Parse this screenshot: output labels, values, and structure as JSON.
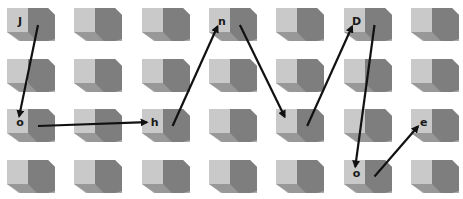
{
  "diagram": {
    "type": "cube-grid-path",
    "rows": 4,
    "cols": 7,
    "colors": {
      "front_face": "#c9c9c9",
      "side_face": "#7e7e7e",
      "bottom_face": "#8f8f8f",
      "edge_face": "#a9a9a9",
      "arrow": "#111111",
      "letter": "#1a1a1a",
      "background": "#ffffff"
    },
    "letters": [
      {
        "row": 0,
        "col": 0,
        "char": "J"
      },
      {
        "row": 2,
        "col": 0,
        "char": "o"
      },
      {
        "row": 2,
        "col": 2,
        "char": "h"
      },
      {
        "row": 0,
        "col": 3,
        "char": "n"
      },
      {
        "row": 0,
        "col": 5,
        "char": "D"
      },
      {
        "row": 3,
        "col": 5,
        "char": "o"
      },
      {
        "row": 2,
        "col": 6,
        "char": "e"
      }
    ],
    "path": [
      {
        "from": [
          0,
          0
        ],
        "to": [
          2,
          0
        ]
      },
      {
        "from": [
          2,
          0
        ],
        "to": [
          2,
          2
        ]
      },
      {
        "from": [
          2,
          2
        ],
        "to": [
          0,
          3
        ]
      },
      {
        "from": [
          0,
          3
        ],
        "to": [
          2,
          4
        ]
      },
      {
        "from": [
          2,
          4
        ],
        "to": [
          0,
          5
        ]
      },
      {
        "from": [
          0,
          5
        ],
        "to": [
          3,
          5
        ]
      },
      {
        "from": [
          3,
          5
        ],
        "to": [
          2,
          6
        ]
      }
    ],
    "spelled_text": "JohnDoe"
  }
}
